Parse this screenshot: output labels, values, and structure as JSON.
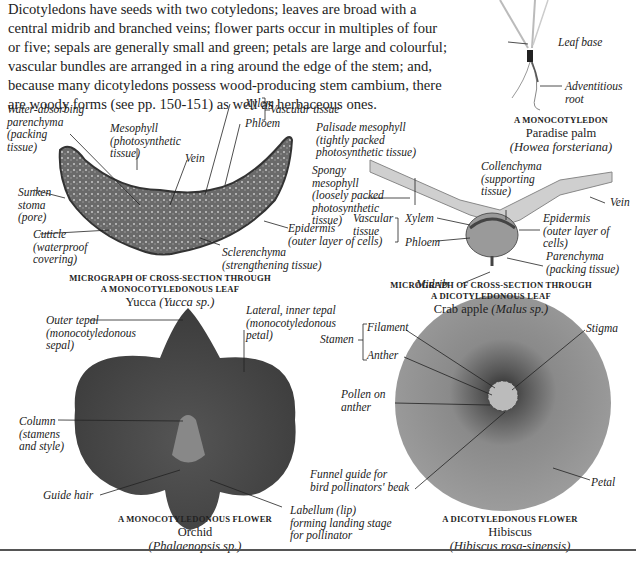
{
  "intro": {
    "text": "Dicotyledons have seeds with two cotyledons; leaves are broad with a central midrib and branched veins; flower parts occur in multiples of four or five; sepals are generally small and green; petals are large and colourful; vascular bundles are arranged in a ring around the edge of the stem; and, because many dicotyledons possess wood-producing stem cambium, there are woody forms (see pp. 150-151) as well as herbaceous ones."
  },
  "palm": {
    "labels": {
      "leaf_base": "Leaf base",
      "adventitious_root": "Adventitious\nroot"
    },
    "caption": {
      "heading": "A MONOCOTYLEDON",
      "name": "Paradise palm",
      "latin": "(Howea forsteriana)"
    }
  },
  "yucca_leaf": {
    "labels": {
      "water_absorbing": "Water-absorbing\nparenchyma\n(packing\ntissue)",
      "mesophyll": "Mesophyll\n(photosynthetic\ntissue)",
      "vein": "Vein",
      "xylem": "Xylem",
      "phloem": "Phloem",
      "vascular_tissue": "Vascular tissue",
      "sunken_stoma": "Sunken\nstoma\n(pore)",
      "cuticle": "Cuticle\n(waterproof\ncovering)",
      "epidermis": "Epidermis\n(outer layer of cells)",
      "sclerenchyma": "Sclerenchyma\n(strengthening tissue)"
    },
    "caption": {
      "heading_line1": "MICROGRAPH OF CROSS-SECTION THROUGH",
      "heading_line2": "A MONOCOTYLEDONOUS LEAF",
      "name": "Yucca",
      "latin": "(Yucca sp.)"
    }
  },
  "crabapple_leaf": {
    "labels": {
      "palisade": "Palisade mesophyll\n(tightly packed\nphotosynthetic tissue)",
      "spongy": "Spongy\nmesophyll\n(loosely packed\nphotosynthetic\ntissue)",
      "collenchyma": "Collenchyma\n(supporting\ntissue)",
      "vein": "Vein",
      "vascular_tissue": "Vascular\ntissue",
      "xylem": "Xylem",
      "phloem": "Phloem",
      "epidermis": "Epidermis\n(outer layer of\ncells)",
      "parenchyma": "Parenchyma\n(packing tissue)",
      "midrib": "Midrib"
    },
    "caption": {
      "heading_line1": "MICROGRAPH OF CROSS-SECTION THROUGH",
      "heading_line2": "A DICOTYLEDONOUS LEAF",
      "name": "Crab apple",
      "latin": "(Malus sp.)"
    }
  },
  "orchid": {
    "labels": {
      "outer_tepal": "Outer tepal\n(monocotyledonous\nsepal)",
      "lateral_tepal": "Lateral, inner tepal\n(monocotyledonous\npetal)",
      "column": "Column\n(stamens\nand style)",
      "guide_hair": "Guide hair",
      "labellum": "Labellum (lip)\nforming landing stage\nfor pollinator"
    },
    "caption": {
      "heading": "A MONOCOTYLEDONOUS FLOWER",
      "name": "Orchid",
      "latin": "(Phalaenopsis sp.)"
    }
  },
  "hibiscus": {
    "labels": {
      "stamen": "Stamen",
      "filament": "Filament",
      "anther": "Anther",
      "pollen": "Pollen on\nanther",
      "stigma": "Stigma",
      "funnel": "Funnel guide for\nbird pollinators' beak",
      "petal": "Petal"
    },
    "caption": {
      "heading": "A DICOTYLEDONOUS FLOWER",
      "name": "Hibiscus",
      "latin": "(Hibiscus rosa-sinensis)"
    }
  }
}
